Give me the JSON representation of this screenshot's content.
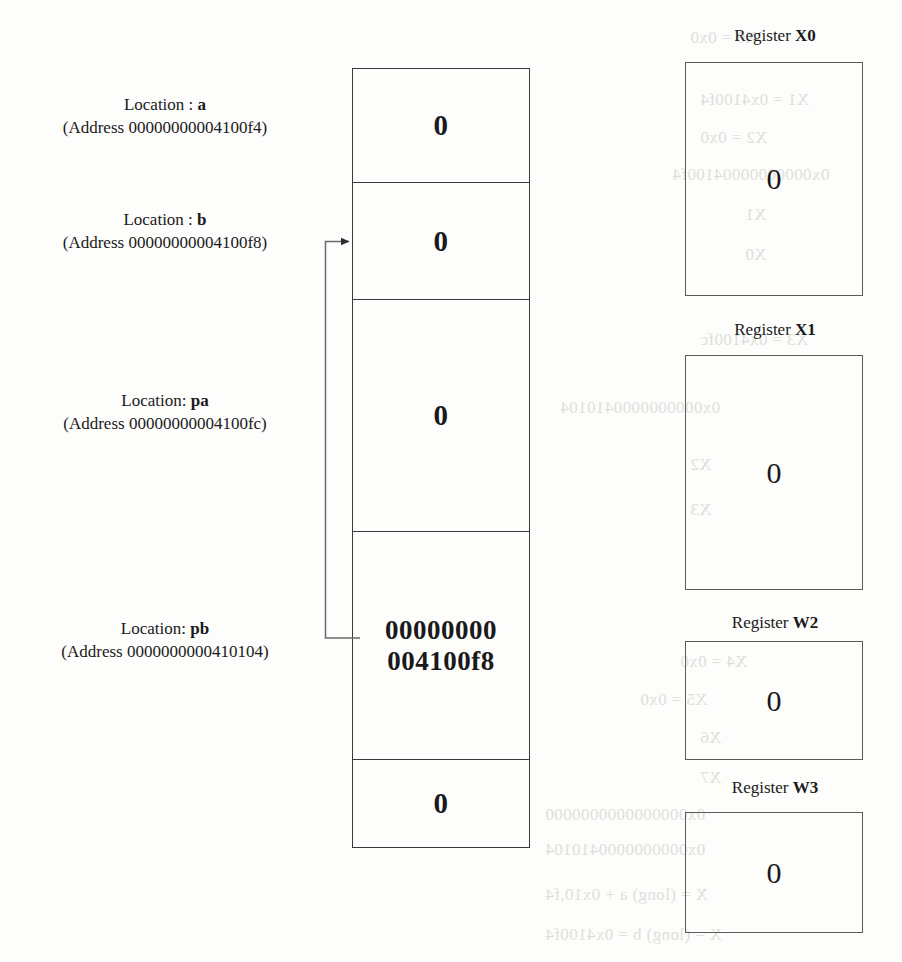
{
  "memory": {
    "cells": [
      {
        "label_line1_prefix": "Location : ",
        "label_symbol": "a",
        "label_line2": "(Address 00000000004100f4)",
        "value": "0"
      },
      {
        "label_line1_prefix": "Location : ",
        "label_symbol": "b",
        "label_line2": "(Address 00000000004100f8)",
        "value": "0"
      },
      {
        "label_line1_prefix": "Location: ",
        "label_symbol": "pa",
        "label_line2": "(Address 00000000004100fc)",
        "value": "0"
      },
      {
        "label_line1_prefix": "Location: ",
        "label_symbol": "pb",
        "label_line2": "(Address 0000000000410104)",
        "value_line1": "00000000",
        "value_line2": "004100f8"
      },
      {
        "label_line1_prefix": "",
        "label_symbol": "",
        "label_line2": "",
        "value": "0"
      }
    ]
  },
  "registers": [
    {
      "label_prefix": "Register ",
      "name": "X0",
      "value": "0"
    },
    {
      "label_prefix": "Register ",
      "name": "X1",
      "value": "0"
    },
    {
      "label_prefix": "Register ",
      "name": "W2",
      "value": "0"
    },
    {
      "label_prefix": "Register ",
      "name": "W3",
      "value": "0"
    }
  ],
  "pointer": {
    "from_cell": "pb",
    "to_cell": "b",
    "icon": "arrow-right-icon"
  },
  "colors": {
    "ink": "#1a1a1a",
    "memory_border": "#3a3a3a",
    "register_border": "#5a5a58",
    "arrow": "#5a5a58",
    "page": "#fdfdfc",
    "ghost": "#c9c6c0"
  },
  "ghost_text": {
    "lines": [
      "X0 = 0x0",
      "X1 = 0x4100f4",
      "0x00000000004100f4",
      "X1",
      "X0",
      "X2 = 0x0",
      "X3 = 0x4100fc",
      "0x0000000000410104",
      "X2",
      "X3",
      "X4 = 0x0",
      "X5 = 0x0",
      "0x0000000000410104",
      "X6",
      "X7",
      "0x0000000000000000",
      "X = (long) a + 0x10,f4",
      "X = (long) b = 0x4100f4"
    ]
  }
}
